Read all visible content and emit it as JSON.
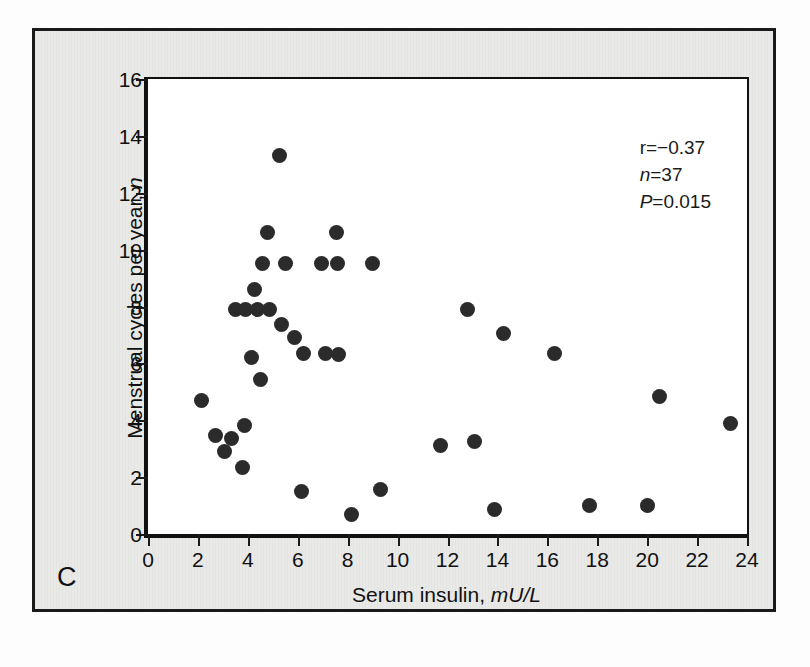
{
  "figure": {
    "panel_letter": "C",
    "background_color": "#e9e9e7",
    "frame_color": "#1a1a1a",
    "point_color": "#2b2b2b"
  },
  "annotations": {
    "r_label": "r=",
    "r_value": "−0.37",
    "n_label": "n",
    "n_value": "=37",
    "p_label": "P",
    "p_value": "=0.015"
  },
  "chart_data": {
    "type": "scatter",
    "title": "",
    "xlabel_text": "Serum insulin, ",
    "xlabel_units": "mU/L",
    "ylabel_text": "Menstrual cycles per year, ",
    "ylabel_units": "n",
    "xlim": [
      0,
      24
    ],
    "ylim": [
      0,
      16
    ],
    "xticks": [
      0,
      2,
      4,
      6,
      8,
      10,
      12,
      14,
      16,
      18,
      20,
      22,
      24
    ],
    "xticklabels": [
      "0",
      "2",
      "4",
      "6",
      "8",
      "10",
      "12",
      "14",
      "16",
      "18",
      "20",
      "22",
      "24"
    ],
    "yticks": [
      0,
      2,
      4,
      6,
      8,
      10,
      12,
      14,
      16
    ],
    "yticklabels": [
      "0",
      "2",
      "4",
      "6",
      "8",
      "10",
      "12",
      "14",
      "16"
    ],
    "grid": false,
    "legend": false,
    "n_points": 37,
    "correlation_r": -0.37,
    "p_value": 0.015,
    "series": [
      {
        "name": "Subjects",
        "x": [
          2.15,
          2.7,
          3.05,
          3.35,
          3.5,
          3.8,
          3.85,
          3.9,
          4.15,
          4.25,
          4.4,
          4.5,
          4.6,
          4.8,
          4.85,
          5.25,
          5.35,
          5.5,
          5.85,
          6.15,
          6.25,
          6.95,
          7.1,
          7.55,
          7.6,
          7.65,
          8.15,
          9.0,
          9.3,
          11.7,
          12.8,
          13.1,
          13.9,
          14.25,
          16.3,
          17.7,
          20.0,
          20.5,
          23.35
        ],
        "y": [
          4.7,
          3.45,
          2.9,
          3.35,
          7.9,
          2.35,
          3.8,
          7.9,
          6.2,
          8.6,
          7.9,
          5.45,
          9.5,
          10.6,
          7.9,
          13.3,
          7.35,
          9.5,
          6.9,
          1.5,
          6.35,
          9.5,
          6.35,
          10.6,
          9.5,
          6.3,
          0.7,
          9.5,
          1.55,
          3.1,
          7.9,
          3.25,
          0.85,
          7.05,
          6.35,
          1.0,
          1.0,
          4.85,
          3.9
        ]
      }
    ]
  }
}
